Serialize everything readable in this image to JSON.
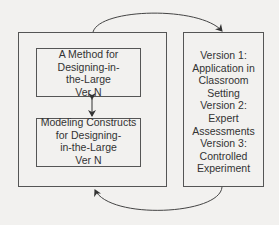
{
  "diagram": {
    "left_container": {
      "top_box": {
        "lines": [
          "A Method for",
          "Designing-in-",
          "the-Large",
          "Ver N"
        ]
      },
      "bottom_box": {
        "lines": [
          "Modeling Constructs",
          "for Designing-",
          "in-the-Large",
          "Ver N"
        ]
      }
    },
    "right_box": {
      "lines": [
        "Version 1:",
        "Application in",
        "Classroom",
        "Setting",
        "Version 2:",
        "Expert",
        "Assessments",
        "Version 3:",
        "Controlled",
        "Experiment"
      ]
    },
    "arrows": [
      {
        "from": "left_container",
        "to": "right_box",
        "style": "curved-top"
      },
      {
        "from": "right_box",
        "to": "left_container",
        "style": "curved-bottom"
      },
      {
        "from": "top_box",
        "to": "bottom_box",
        "style": "bidirectional-vertical"
      }
    ],
    "colors": {
      "line": "#555555",
      "background": "#f2f1ef",
      "text": "#333333"
    }
  }
}
